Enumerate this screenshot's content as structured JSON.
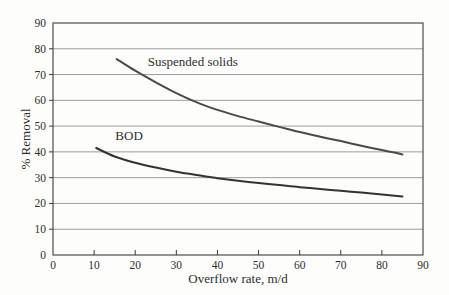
{
  "figure": {
    "background": "#fdfdfc",
    "text_color": "#2e2e2e",
    "grid_color": "#929292",
    "frame_color": "#3c3c3c"
  },
  "chart_data": {
    "type": "line",
    "title": "",
    "xlabel": "Overflow rate, m/d",
    "ylabel": "% Removal",
    "xlim": [
      0,
      90
    ],
    "ylim": [
      0,
      90
    ],
    "x_ticks": [
      0,
      10,
      20,
      30,
      40,
      50,
      60,
      70,
      80,
      90
    ],
    "y_ticks": [
      0,
      10,
      20,
      30,
      40,
      50,
      60,
      70,
      80,
      90
    ],
    "grid": "horizontal-only",
    "legend": "inline-labels",
    "series": [
      {
        "name": "Suspended solids",
        "color": "#4a4a4a",
        "stroke_width": 2,
        "label_pos": {
          "x": 34,
          "y": 75
        },
        "points": [
          [
            15.5,
            76
          ],
          [
            20,
            71.5
          ],
          [
            25,
            67
          ],
          [
            30,
            62.8
          ],
          [
            35,
            59.2
          ],
          [
            40,
            56.3
          ],
          [
            45,
            53.9
          ],
          [
            50,
            51.8
          ],
          [
            55,
            49.7
          ],
          [
            60,
            47.7
          ],
          [
            65,
            45.9
          ],
          [
            70,
            44.2
          ],
          [
            75,
            42.4
          ],
          [
            80,
            40.7
          ],
          [
            85,
            39
          ]
        ]
      },
      {
        "name": "BOD",
        "color": "#333333",
        "stroke_width": 2,
        "label_pos": {
          "x": 18.5,
          "y": 46
        },
        "points": [
          [
            10.5,
            41.5
          ],
          [
            15,
            38.2
          ],
          [
            20,
            35.8
          ],
          [
            25,
            33.9
          ],
          [
            30,
            32.3
          ],
          [
            35,
            31
          ],
          [
            40,
            29.8
          ],
          [
            45,
            28.8
          ],
          [
            50,
            27.9
          ],
          [
            55,
            27.1
          ],
          [
            60,
            26.3
          ],
          [
            65,
            25.6
          ],
          [
            70,
            24.9
          ],
          [
            75,
            24.2
          ],
          [
            80,
            23.5
          ],
          [
            85,
            22.7
          ]
        ]
      }
    ]
  }
}
